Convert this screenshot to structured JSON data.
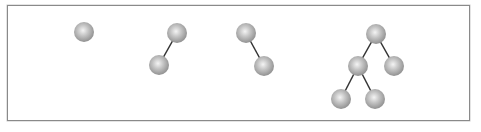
{
  "diagram": {
    "title": "",
    "node_color": "#b5b5b5",
    "edge_color": "#333333",
    "node_radius": 10,
    "trees": [
      {
        "id": "tree-1",
        "nodes": [
          {
            "id": "a",
            "x": 84,
            "y": 32
          }
        ],
        "edges": []
      },
      {
        "id": "tree-2",
        "nodes": [
          {
            "id": "a",
            "x": 177,
            "y": 33
          },
          {
            "id": "b",
            "x": 159,
            "y": 65
          }
        ],
        "edges": [
          [
            "a",
            "b"
          ]
        ]
      },
      {
        "id": "tree-3",
        "nodes": [
          {
            "id": "a",
            "x": 246,
            "y": 33
          },
          {
            "id": "b",
            "x": 264,
            "y": 66
          }
        ],
        "edges": [
          [
            "a",
            "b"
          ]
        ]
      },
      {
        "id": "tree-4",
        "nodes": [
          {
            "id": "a",
            "x": 376,
            "y": 34
          },
          {
            "id": "b",
            "x": 358,
            "y": 66
          },
          {
            "id": "c",
            "x": 394,
            "y": 66
          },
          {
            "id": "d",
            "x": 341,
            "y": 99
          },
          {
            "id": "e",
            "x": 375,
            "y": 99
          }
        ],
        "edges": [
          [
            "a",
            "b"
          ],
          [
            "a",
            "c"
          ],
          [
            "b",
            "d"
          ],
          [
            "b",
            "e"
          ]
        ]
      }
    ]
  }
}
